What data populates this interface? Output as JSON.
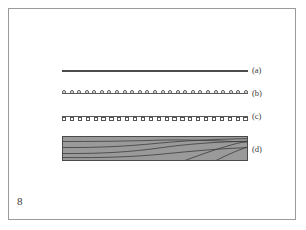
{
  "page": {
    "page_number": "8",
    "background_color": "#ffffff",
    "frame_color": "#9a9a9a"
  },
  "figure": {
    "caption_labels": [
      "(a)",
      "(b)",
      "(c)",
      "(d)"
    ],
    "rows": [
      {
        "id": "row-a",
        "label": "(a)",
        "type": "plain-line",
        "description": "plain horizontal line",
        "line_color": "#4b4b4b",
        "y": 70,
        "x_start": 62,
        "x_end": 248,
        "marker_count": 0,
        "marker_shape": "none",
        "marker_side": "none"
      },
      {
        "id": "row-b",
        "label": "(b)",
        "type": "line-with-markers",
        "description": "horizontal line with circular markers above",
        "line_color": "#5a5a5a",
        "y": 93,
        "x_start": 62,
        "x_end": 248,
        "marker_count": 25,
        "marker_shape": "circle",
        "marker_side": "above",
        "marker_fill": "#ffffff",
        "marker_stroke": "#555555"
      },
      {
        "id": "row-c",
        "label": "(c)",
        "type": "line-with-markers",
        "description": "horizontal line with square markers below",
        "line_color": "#5a5a5a",
        "y": 116,
        "x_start": 62,
        "x_end": 248,
        "marker_count": 24,
        "marker_shape": "square",
        "marker_side": "below",
        "marker_fill": "#ffffff",
        "marker_stroke": "#555555"
      },
      {
        "id": "row-d",
        "label": "(d)",
        "type": "wood-block",
        "description": "gray rectangular wood block with grain lines",
        "fill_color": "#9a9a9a",
        "stroke_color": "#4a4a4a",
        "grain_color": "#3c3c3c",
        "y": 136,
        "height": 25,
        "x_start": 62,
        "x_end": 248,
        "grain_line_count": 5
      }
    ]
  }
}
